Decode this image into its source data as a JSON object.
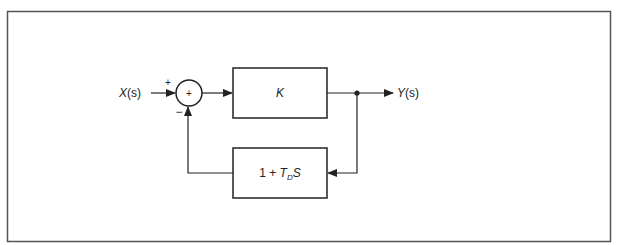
{
  "diagram": {
    "type": "block-diagram",
    "title": "",
    "input_label": {
      "var": "X",
      "arg": "(s)"
    },
    "output_label": {
      "var": "Y",
      "arg": "(s)"
    },
    "summing_junction": {
      "center_sign": "+",
      "input_sign_left": "+",
      "input_sign_bottom": "−"
    },
    "forward_block": {
      "label": "K"
    },
    "feedback_block": {
      "prefix": "1 + ",
      "T": "T",
      "sub": "D",
      "suffix": "S"
    },
    "colors": {
      "line": "#222222",
      "frame": "#555555",
      "background": "#ffffff"
    }
  }
}
